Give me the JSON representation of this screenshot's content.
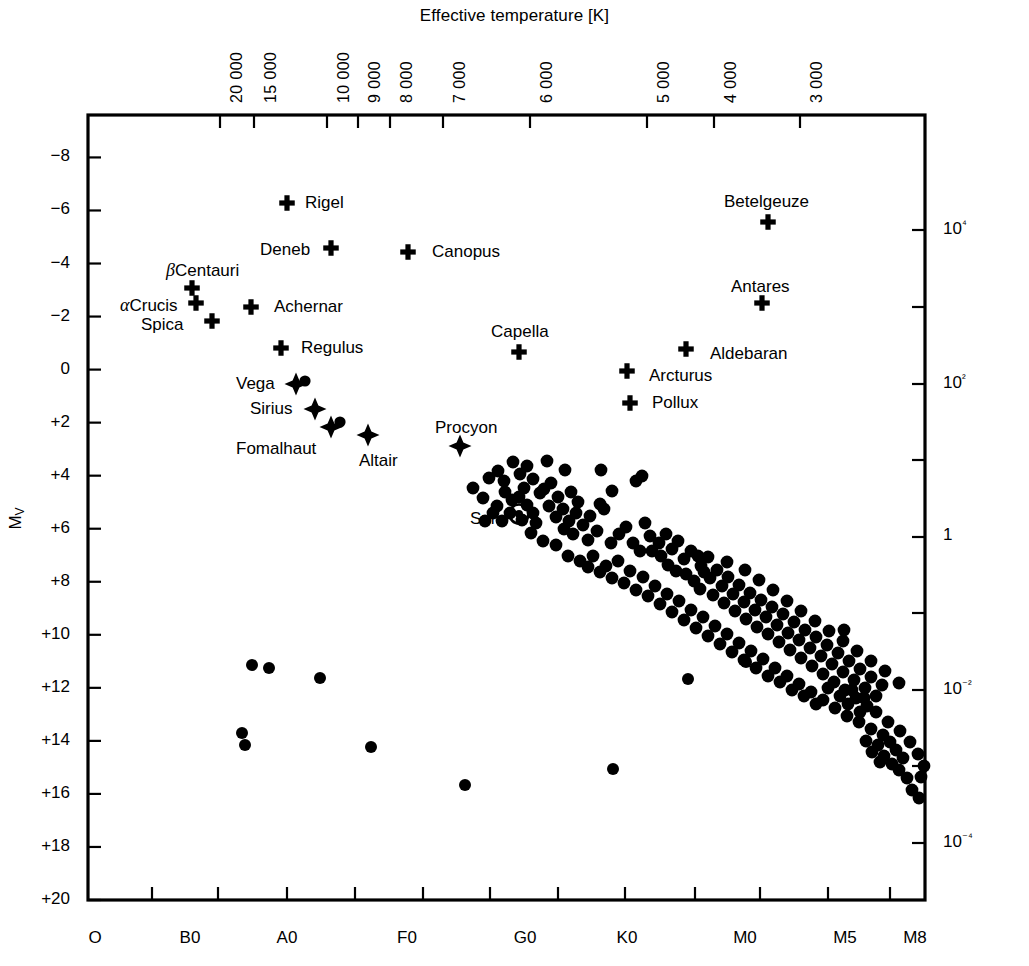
{
  "figure": {
    "type": "hertzsprung-russell-diagram",
    "background": "#ffffff",
    "foreground": "#000000"
  },
  "chart_data": {
    "type": "scatter",
    "title": "",
    "xlabel": "",
    "ylabel": "M_V",
    "top_axis": {
      "label": "Effective temperature [K]",
      "ticks": [
        "20000",
        "15000",
        "10000",
        "9000",
        "8000",
        "7000",
        "6000",
        "5000",
        "4000",
        "3000"
      ],
      "tick_px": [
        220,
        254,
        327,
        358,
        390,
        443,
        530,
        647,
        714,
        800
      ]
    },
    "bottom_axis": {
      "label": "",
      "ticks": [
        "O",
        "B0",
        "A0",
        "F0",
        "G0",
        "K0",
        "M0",
        "M5",
        "M8"
      ],
      "tick_px": [
        95,
        190,
        287,
        407,
        525,
        627,
        745,
        845,
        915
      ],
      "tick_mark_px": [
        152,
        218,
        287,
        355,
        423,
        490,
        558,
        625,
        695,
        760,
        828,
        890
      ]
    },
    "left_axis": {
      "label": "M",
      "label_sub": "V",
      "ticks": [
        "−8",
        "−6",
        "−4",
        "−2",
        "0",
        "+2",
        "+4",
        "+6",
        "+8",
        "+10",
        "+12",
        "+14",
        "+16",
        "+18",
        "+20"
      ],
      "values": [
        -8,
        -6,
        -4,
        -2,
        0,
        2,
        4,
        6,
        8,
        10,
        12,
        14,
        16,
        18,
        20
      ],
      "range": [
        -9.6,
        20.0
      ],
      "grid": false
    },
    "right_axis": {
      "label": "Luminosity [L☉]",
      "ticks": [
        "10⁴",
        "",
        "10²",
        "",
        "1",
        "",
        "10⁻²",
        "",
        "10⁻⁴"
      ],
      "tick_px": [
        230,
        307,
        384,
        460,
        537,
        613,
        690,
        766,
        843
      ]
    },
    "named_stars": [
      {
        "name": "Rigel",
        "marker": "cross",
        "x": 287,
        "y": 203,
        "label_x": 305,
        "label_y": 194,
        "anchor": "left"
      },
      {
        "name": "Betelgeuze",
        "marker": "cross",
        "x": 768,
        "y": 222,
        "label_x": 724,
        "label_y": 193,
        "anchor": "left"
      },
      {
        "name": "Deneb",
        "marker": "cross",
        "x": 331,
        "y": 248,
        "label_x": 260,
        "label_y": 241,
        "anchor": "left"
      },
      {
        "name": "Canopus",
        "marker": "cross",
        "x": 408,
        "y": 252,
        "label_x": 432,
        "label_y": 243,
        "anchor": "left"
      },
      {
        "name": "βCentauri",
        "marker": "cross",
        "x": 192,
        "y": 288,
        "label_x": 166,
        "label_y": 261,
        "anchor": "left",
        "greek": "β",
        "rest": "Centauri"
      },
      {
        "name": "Antares",
        "marker": "cross",
        "x": 762,
        "y": 303,
        "label_x": 731,
        "label_y": 278,
        "anchor": "left"
      },
      {
        "name": "αCrucis",
        "marker": "cross",
        "x": 196,
        "y": 303,
        "label_x": 120,
        "label_y": 296,
        "anchor": "left",
        "greek": "α",
        "rest": "Crucis"
      },
      {
        "name": "Achernar",
        "marker": "cross",
        "x": 251,
        "y": 307,
        "label_x": 274,
        "label_y": 298,
        "anchor": "left"
      },
      {
        "name": "Spica",
        "marker": "cross",
        "x": 212,
        "y": 321,
        "label_x": 141,
        "label_y": 316,
        "anchor": "left"
      },
      {
        "name": "Capella",
        "marker": "cross",
        "x": 519,
        "y": 352,
        "label_x": 491,
        "label_y": 323,
        "anchor": "left"
      },
      {
        "name": "Regulus",
        "marker": "cross",
        "x": 281,
        "y": 348,
        "label_x": 301,
        "label_y": 339,
        "anchor": "left"
      },
      {
        "name": "Aldebaran",
        "marker": "cross",
        "x": 686,
        "y": 349,
        "label_x": 710,
        "label_y": 345,
        "anchor": "left"
      },
      {
        "name": "Arcturus",
        "marker": "cross",
        "x": 627,
        "y": 371,
        "label_x": 649,
        "label_y": 367,
        "anchor": "left"
      },
      {
        "name": "Vega",
        "marker": "star4",
        "x": 296,
        "y": 384,
        "label_x": 236,
        "label_y": 375,
        "anchor": "left"
      },
      {
        "name": "Pollux",
        "marker": "cross",
        "x": 630,
        "y": 403,
        "label_x": 652,
        "label_y": 394,
        "anchor": "left"
      },
      {
        "name": "Sirius",
        "marker": "star4",
        "x": 315,
        "y": 409,
        "label_x": 250,
        "label_y": 400,
        "anchor": "left"
      },
      {
        "name": "Fomalhaut",
        "marker": "star4",
        "x": 331,
        "y": 427,
        "label_x": 236,
        "label_y": 440,
        "anchor": "left"
      },
      {
        "name": "Procyon",
        "marker": "star4",
        "x": 460,
        "y": 446,
        "label_x": 435,
        "label_y": 419,
        "anchor": "left"
      },
      {
        "name": "Altair",
        "marker": "star4",
        "x": 368,
        "y": 435,
        "label_x": 359,
        "label_y": 452,
        "anchor": "left"
      },
      {
        "name": "Sun",
        "marker": "sun",
        "x": 519,
        "y": 514,
        "label_x": 470,
        "label_y": 510,
        "anchor": "left"
      }
    ],
    "companion_dots": [
      {
        "x": 305,
        "y": 381
      },
      {
        "x": 340,
        "y": 422
      }
    ],
    "white_dwarfs": [
      {
        "x": 252,
        "y": 665
      },
      {
        "x": 269,
        "y": 668
      },
      {
        "x": 320,
        "y": 678
      },
      {
        "x": 242,
        "y": 733
      },
      {
        "x": 245,
        "y": 745
      },
      {
        "x": 371,
        "y": 747
      },
      {
        "x": 465,
        "y": 785
      },
      {
        "x": 613,
        "y": 769
      },
      {
        "x": 688,
        "y": 679
      },
      {
        "x": 746,
        "y": 662
      }
    ],
    "main_sequence": [
      {
        "x": 473,
        "y": 488
      },
      {
        "x": 489,
        "y": 478
      },
      {
        "x": 483,
        "y": 498
      },
      {
        "x": 498,
        "y": 471
      },
      {
        "x": 504,
        "y": 481
      },
      {
        "x": 513,
        "y": 462
      },
      {
        "x": 520,
        "y": 474
      },
      {
        "x": 505,
        "y": 492
      },
      {
        "x": 512,
        "y": 500
      },
      {
        "x": 497,
        "y": 506
      },
      {
        "x": 527,
        "y": 466
      },
      {
        "x": 533,
        "y": 479
      },
      {
        "x": 524,
        "y": 488
      },
      {
        "x": 519,
        "y": 497
      },
      {
        "x": 527,
        "y": 505
      },
      {
        "x": 533,
        "y": 513
      },
      {
        "x": 522,
        "y": 520
      },
      {
        "x": 536,
        "y": 523
      },
      {
        "x": 544,
        "y": 489
      },
      {
        "x": 551,
        "y": 483
      },
      {
        "x": 558,
        "y": 497
      },
      {
        "x": 549,
        "y": 506
      },
      {
        "x": 563,
        "y": 509
      },
      {
        "x": 556,
        "y": 517
      },
      {
        "x": 571,
        "y": 492
      },
      {
        "x": 578,
        "y": 502
      },
      {
        "x": 569,
        "y": 521
      },
      {
        "x": 576,
        "y": 513
      },
      {
        "x": 564,
        "y": 529
      },
      {
        "x": 573,
        "y": 534
      },
      {
        "x": 583,
        "y": 525
      },
      {
        "x": 590,
        "y": 516
      },
      {
        "x": 597,
        "y": 531
      },
      {
        "x": 588,
        "y": 540
      },
      {
        "x": 601,
        "y": 470
      },
      {
        "x": 604,
        "y": 509
      },
      {
        "x": 611,
        "y": 543
      },
      {
        "x": 619,
        "y": 534
      },
      {
        "x": 626,
        "y": 527
      },
      {
        "x": 633,
        "y": 543
      },
      {
        "x": 642,
        "y": 476
      },
      {
        "x": 645,
        "y": 523
      },
      {
        "x": 650,
        "y": 536
      },
      {
        "x": 640,
        "y": 551
      },
      {
        "x": 652,
        "y": 551
      },
      {
        "x": 659,
        "y": 543
      },
      {
        "x": 666,
        "y": 534
      },
      {
        "x": 661,
        "y": 556
      },
      {
        "x": 672,
        "y": 549
      },
      {
        "x": 678,
        "y": 541
      },
      {
        "x": 668,
        "y": 565
      },
      {
        "x": 676,
        "y": 571
      },
      {
        "x": 684,
        "y": 559
      },
      {
        "x": 691,
        "y": 551
      },
      {
        "x": 686,
        "y": 574
      },
      {
        "x": 694,
        "y": 581
      },
      {
        "x": 701,
        "y": 566
      },
      {
        "x": 708,
        "y": 557
      },
      {
        "x": 700,
        "y": 589
      },
      {
        "x": 710,
        "y": 578
      },
      {
        "x": 717,
        "y": 570
      },
      {
        "x": 713,
        "y": 595
      },
      {
        "x": 722,
        "y": 586
      },
      {
        "x": 728,
        "y": 577
      },
      {
        "x": 724,
        "y": 603
      },
      {
        "x": 733,
        "y": 594
      },
      {
        "x": 739,
        "y": 585
      },
      {
        "x": 735,
        "y": 611
      },
      {
        "x": 744,
        "y": 602
      },
      {
        "x": 750,
        "y": 593
      },
      {
        "x": 746,
        "y": 619
      },
      {
        "x": 755,
        "y": 610
      },
      {
        "x": 761,
        "y": 600
      },
      {
        "x": 757,
        "y": 627
      },
      {
        "x": 766,
        "y": 617
      },
      {
        "x": 772,
        "y": 607
      },
      {
        "x": 768,
        "y": 634
      },
      {
        "x": 777,
        "y": 625
      },
      {
        "x": 783,
        "y": 614
      },
      {
        "x": 779,
        "y": 642
      },
      {
        "x": 788,
        "y": 633
      },
      {
        "x": 794,
        "y": 622
      },
      {
        "x": 790,
        "y": 650
      },
      {
        "x": 799,
        "y": 640
      },
      {
        "x": 805,
        "y": 630
      },
      {
        "x": 801,
        "y": 658
      },
      {
        "x": 810,
        "y": 648
      },
      {
        "x": 816,
        "y": 637
      },
      {
        "x": 812,
        "y": 666
      },
      {
        "x": 821,
        "y": 656
      },
      {
        "x": 827,
        "y": 645
      },
      {
        "x": 823,
        "y": 674
      },
      {
        "x": 832,
        "y": 664
      },
      {
        "x": 838,
        "y": 653
      },
      {
        "x": 834,
        "y": 682
      },
      {
        "x": 843,
        "y": 672
      },
      {
        "x": 849,
        "y": 661
      },
      {
        "x": 845,
        "y": 690
      },
      {
        "x": 854,
        "y": 680
      },
      {
        "x": 860,
        "y": 669
      },
      {
        "x": 856,
        "y": 698
      },
      {
        "x": 865,
        "y": 688
      },
      {
        "x": 871,
        "y": 677
      },
      {
        "x": 867,
        "y": 706
      },
      {
        "x": 876,
        "y": 696
      },
      {
        "x": 882,
        "y": 685
      },
      {
        "x": 612,
        "y": 491
      },
      {
        "x": 636,
        "y": 481
      },
      {
        "x": 600,
        "y": 504
      },
      {
        "x": 565,
        "y": 470
      },
      {
        "x": 547,
        "y": 461
      },
      {
        "x": 540,
        "y": 493
      },
      {
        "x": 510,
        "y": 513
      },
      {
        "x": 502,
        "y": 521
      },
      {
        "x": 493,
        "y": 513
      },
      {
        "x": 485,
        "y": 521
      },
      {
        "x": 531,
        "y": 533
      },
      {
        "x": 543,
        "y": 541
      },
      {
        "x": 556,
        "y": 545
      },
      {
        "x": 568,
        "y": 556
      },
      {
        "x": 580,
        "y": 561
      },
      {
        "x": 593,
        "y": 556
      },
      {
        "x": 606,
        "y": 566
      },
      {
        "x": 618,
        "y": 561
      },
      {
        "x": 630,
        "y": 571
      },
      {
        "x": 643,
        "y": 577
      },
      {
        "x": 655,
        "y": 586
      },
      {
        "x": 667,
        "y": 594
      },
      {
        "x": 679,
        "y": 601
      },
      {
        "x": 691,
        "y": 610
      },
      {
        "x": 703,
        "y": 617
      },
      {
        "x": 715,
        "y": 626
      },
      {
        "x": 727,
        "y": 634
      },
      {
        "x": 739,
        "y": 643
      },
      {
        "x": 751,
        "y": 651
      },
      {
        "x": 763,
        "y": 659
      },
      {
        "x": 775,
        "y": 668
      },
      {
        "x": 787,
        "y": 676
      },
      {
        "x": 799,
        "y": 684
      },
      {
        "x": 811,
        "y": 692
      },
      {
        "x": 823,
        "y": 700
      },
      {
        "x": 835,
        "y": 708
      },
      {
        "x": 847,
        "y": 716
      },
      {
        "x": 859,
        "y": 722
      },
      {
        "x": 871,
        "y": 729
      },
      {
        "x": 883,
        "y": 735
      },
      {
        "x": 866,
        "y": 741
      },
      {
        "x": 878,
        "y": 745
      },
      {
        "x": 890,
        "y": 742
      },
      {
        "x": 872,
        "y": 752
      },
      {
        "x": 884,
        "y": 756
      },
      {
        "x": 896,
        "y": 750
      },
      {
        "x": 880,
        "y": 762
      },
      {
        "x": 892,
        "y": 764
      },
      {
        "x": 903,
        "y": 758
      },
      {
        "x": 899,
        "y": 770
      },
      {
        "x": 907,
        "y": 778
      },
      {
        "x": 912,
        "y": 790
      },
      {
        "x": 919,
        "y": 798
      },
      {
        "x": 860,
        "y": 712
      },
      {
        "x": 848,
        "y": 704
      },
      {
        "x": 840,
        "y": 696
      },
      {
        "x": 852,
        "y": 690
      },
      {
        "x": 864,
        "y": 698
      },
      {
        "x": 876,
        "y": 712
      },
      {
        "x": 888,
        "y": 722
      },
      {
        "x": 900,
        "y": 731
      },
      {
        "x": 844,
        "y": 630
      },
      {
        "x": 828,
        "y": 688
      },
      {
        "x": 816,
        "y": 704
      },
      {
        "x": 804,
        "y": 696
      },
      {
        "x": 792,
        "y": 690
      },
      {
        "x": 780,
        "y": 682
      },
      {
        "x": 768,
        "y": 676
      },
      {
        "x": 756,
        "y": 668
      },
      {
        "x": 744,
        "y": 660
      },
      {
        "x": 732,
        "y": 652
      },
      {
        "x": 720,
        "y": 644
      },
      {
        "x": 708,
        "y": 636
      },
      {
        "x": 696,
        "y": 628
      },
      {
        "x": 684,
        "y": 620
      },
      {
        "x": 672,
        "y": 612
      },
      {
        "x": 660,
        "y": 604
      },
      {
        "x": 648,
        "y": 596
      },
      {
        "x": 636,
        "y": 590
      },
      {
        "x": 624,
        "y": 583
      },
      {
        "x": 612,
        "y": 578
      },
      {
        "x": 600,
        "y": 572
      },
      {
        "x": 588,
        "y": 567
      },
      {
        "x": 704,
        "y": 572
      },
      {
        "x": 698,
        "y": 556
      },
      {
        "x": 727,
        "y": 562
      },
      {
        "x": 745,
        "y": 570
      },
      {
        "x": 759,
        "y": 580
      },
      {
        "x": 773,
        "y": 590
      },
      {
        "x": 787,
        "y": 601
      },
      {
        "x": 801,
        "y": 611
      },
      {
        "x": 815,
        "y": 621
      },
      {
        "x": 829,
        "y": 631
      },
      {
        "x": 843,
        "y": 641
      },
      {
        "x": 857,
        "y": 651
      },
      {
        "x": 871,
        "y": 661
      },
      {
        "x": 885,
        "y": 671
      },
      {
        "x": 899,
        "y": 683
      },
      {
        "x": 910,
        "y": 742
      },
      {
        "x": 918,
        "y": 754
      },
      {
        "x": 924,
        "y": 766
      },
      {
        "x": 921,
        "y": 777
      }
    ]
  },
  "plot_frame": {
    "left": 88,
    "top": 115,
    "right": 925,
    "bottom": 900
  }
}
